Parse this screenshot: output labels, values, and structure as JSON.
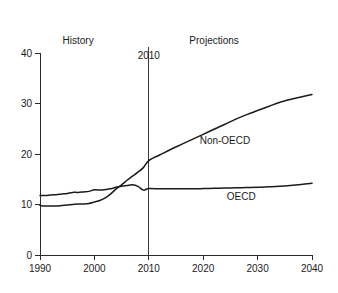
{
  "chart_data": {
    "type": "line",
    "title": "",
    "xlabel": "",
    "ylabel": "",
    "xlim": [
      1990,
      2040
    ],
    "ylim": [
      0,
      40
    ],
    "grid": false,
    "legend_position": "inline-labels",
    "x_ticks": [
      1990,
      2000,
      2010,
      2020,
      2030,
      2040
    ],
    "y_ticks": [
      0,
      10,
      20,
      30,
      40
    ],
    "annotations": [
      {
        "name": "history",
        "text": "History",
        "x": 1997,
        "y": 42.5
      },
      {
        "name": "projections",
        "text": "Projections",
        "x": 2022,
        "y": 42.5
      },
      {
        "name": "divider",
        "text": "2010",
        "x": 2010,
        "y": 39.5
      }
    ],
    "divider_x": 2010,
    "series": [
      {
        "name": "Non-OECD",
        "label": "Non-OECD",
        "label_x": 2024,
        "label_y": 22.6,
        "x": [
          1990,
          1991,
          1992,
          1993,
          1994,
          1995,
          1996,
          1997,
          1998,
          1999,
          2000,
          2001,
          2002,
          2003,
          2004,
          2005,
          2006,
          2007,
          2008,
          2009,
          2010,
          2012,
          2014,
          2016,
          2018,
          2020,
          2022,
          2024,
          2026,
          2028,
          2030,
          2032,
          2034,
          2036,
          2038,
          2040
        ],
        "values": [
          9.8,
          9.7,
          9.7,
          9.7,
          9.8,
          9.9,
          10.0,
          10.1,
          10.1,
          10.2,
          10.5,
          10.8,
          11.3,
          12.1,
          13.1,
          13.9,
          14.8,
          15.6,
          16.4,
          17.3,
          18.7,
          19.8,
          20.9,
          21.9,
          22.9,
          23.9,
          24.9,
          25.9,
          26.9,
          27.8,
          28.6,
          29.4,
          30.2,
          30.8,
          31.3,
          31.8
        ]
      },
      {
        "name": "OECD",
        "label": "OECD",
        "label_x": 2027,
        "label_y": 11.6,
        "x": [
          1990,
          1991,
          1992,
          1993,
          1994,
          1995,
          1996,
          1997,
          1998,
          1999,
          2000,
          2001,
          2002,
          2003,
          2004,
          2005,
          2006,
          2007,
          2008,
          2009,
          2010,
          2012,
          2014,
          2016,
          2018,
          2020,
          2022,
          2024,
          2026,
          2028,
          2030,
          2032,
          2034,
          2036,
          2038,
          2040
        ],
        "values": [
          11.8,
          11.8,
          11.9,
          11.95,
          12.1,
          12.2,
          12.4,
          12.4,
          12.5,
          12.6,
          12.9,
          12.85,
          12.95,
          13.1,
          13.4,
          13.6,
          13.75,
          13.9,
          13.6,
          12.85,
          13.15,
          13.1,
          13.1,
          13.1,
          13.1,
          13.15,
          13.2,
          13.25,
          13.3,
          13.35,
          13.4,
          13.5,
          13.6,
          13.75,
          13.95,
          14.2
        ]
      }
    ]
  }
}
